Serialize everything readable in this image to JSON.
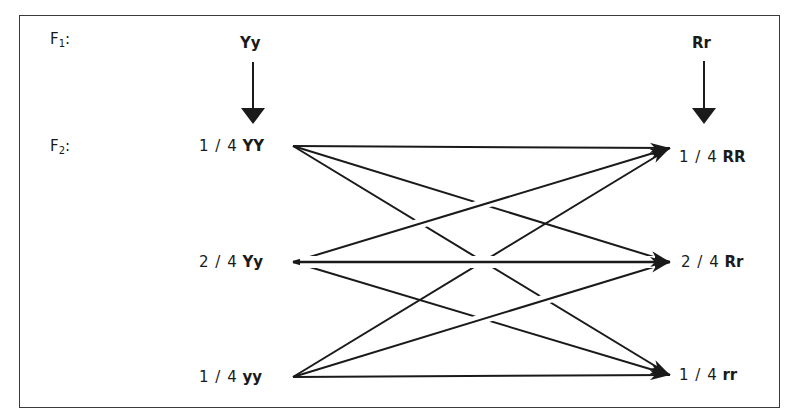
{
  "diagram": {
    "type": "dihybrid-cross-combination",
    "rows": {
      "f1_label": "F",
      "f1_sub": "1",
      "f1_colon": ":",
      "f2_label": "F",
      "f2_sub": "2",
      "f2_colon": ":"
    },
    "f1": {
      "left_parent": "Yy",
      "right_parent": "Rr"
    },
    "f2_left": [
      {
        "fraction": "1 / 4",
        "genotype": "YY"
      },
      {
        "fraction": "2 / 4",
        "genotype": "Yy"
      },
      {
        "fraction": "1 / 4",
        "genotype": "yy"
      }
    ],
    "f2_right": [
      {
        "fraction": "1 / 4",
        "genotype": "RR"
      },
      {
        "fraction": "2 / 4",
        "genotype": "Rr"
      },
      {
        "fraction": "1 / 4",
        "genotype": "rr"
      }
    ],
    "connections": "each left genotype connects by arrow to each right genotype (9 arrows)",
    "colors": {
      "line": "#1a1a1a",
      "frame": "#3a3a3a",
      "background": "#ffffff"
    }
  }
}
